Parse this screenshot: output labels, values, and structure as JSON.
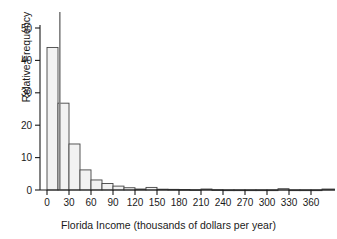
{
  "chart_data": {
    "type": "bar",
    "title": "",
    "xlabel": "Florida Income (thousands of dollars per year)",
    "ylabel": "Relative Frequency",
    "xlim": [
      -8,
      395
    ],
    "ylim": [
      0,
      54
    ],
    "grid": false,
    "legend": null,
    "xticks": [
      0,
      30,
      60,
      90,
      120,
      150,
      180,
      210,
      240,
      270,
      300,
      330,
      360
    ],
    "xtick_labels": [
      "0",
      "30",
      "60",
      "90",
      "120",
      "150",
      "180",
      "210",
      "240",
      "270",
      "300",
      "330",
      "360"
    ],
    "yticks": [
      0,
      10,
      20,
      30,
      40,
      50
    ],
    "ytick_labels": [
      "0",
      "10",
      "20",
      "30",
      "40",
      "50"
    ],
    "bin_width": 15,
    "bins": [
      {
        "x0": 0,
        "x1": 15,
        "value": 44.0
      },
      {
        "x0": 15,
        "x1": 30,
        "value": 26.8
      },
      {
        "x0": 30,
        "x1": 45,
        "value": 14.2
      },
      {
        "x0": 45,
        "x1": 60,
        "value": 6.2
      },
      {
        "x0": 60,
        "x1": 75,
        "value": 3.1
      },
      {
        "x0": 75,
        "x1": 90,
        "value": 2.0
      },
      {
        "x0": 90,
        "x1": 105,
        "value": 1.2
      },
      {
        "x0": 105,
        "x1": 120,
        "value": 0.7
      },
      {
        "x0": 120,
        "x1": 135,
        "value": 0.3
      },
      {
        "x0": 135,
        "x1": 150,
        "value": 0.8
      },
      {
        "x0": 150,
        "x1": 165,
        "value": 0.25
      },
      {
        "x0": 165,
        "x1": 180,
        "value": 0.2
      },
      {
        "x0": 180,
        "x1": 195,
        "value": 0.15
      },
      {
        "x0": 195,
        "x1": 210,
        "value": 0.1
      },
      {
        "x0": 210,
        "x1": 225,
        "value": 0.3
      },
      {
        "x0": 225,
        "x1": 240,
        "value": 0.1
      },
      {
        "x0": 240,
        "x1": 255,
        "value": 0.05
      },
      {
        "x0": 255,
        "x1": 270,
        "value": 0.05
      },
      {
        "x0": 270,
        "x1": 285,
        "value": 0.05
      },
      {
        "x0": 285,
        "x1": 300,
        "value": 0.05
      },
      {
        "x0": 300,
        "x1": 315,
        "value": 0.05
      },
      {
        "x0": 315,
        "x1": 330,
        "value": 0.4
      },
      {
        "x0": 330,
        "x1": 345,
        "value": 0.05
      },
      {
        "x0": 345,
        "x1": 360,
        "value": 0.05
      },
      {
        "x0": 360,
        "x1": 375,
        "value": 0.05
      },
      {
        "x0": 375,
        "x1": 392,
        "value": 0.3
      }
    ],
    "marker_line": {
      "x": 17.5,
      "y_top": 54.0,
      "label": ""
    },
    "colors": {
      "bar_fill": "#f2f2f2",
      "bar_stroke": "#444444",
      "axis": "#1a1a1a",
      "text": "#1a1a1a",
      "marker": "#808080",
      "background": "#ffffff"
    }
  }
}
